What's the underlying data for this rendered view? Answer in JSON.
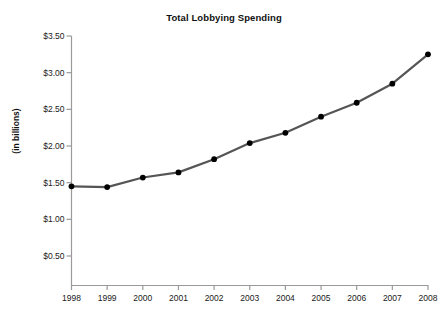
{
  "chart_data": {
    "type": "line",
    "title": "Total Lobbying Spending",
    "xlabel": "",
    "ylabel": "(in billions)",
    "x": [
      1998,
      1999,
      2000,
      2001,
      2002,
      2003,
      2004,
      2005,
      2006,
      2007,
      2008
    ],
    "categories": [
      "1998",
      "1999",
      "2000",
      "2001",
      "2002",
      "2003",
      "2004",
      "2005",
      "2006",
      "2007",
      "2008"
    ],
    "values": [
      1.45,
      1.44,
      1.57,
      1.64,
      1.82,
      2.04,
      2.18,
      2.4,
      2.59,
      2.85,
      3.25
    ],
    "series": [
      {
        "name": "Total Lobbying Spending",
        "values": [
          1.45,
          1.44,
          1.57,
          1.64,
          1.82,
          2.04,
          2.18,
          2.4,
          2.59,
          2.85,
          3.25
        ]
      }
    ],
    "xlim": [
      1998,
      2008
    ],
    "ylim": [
      0.0,
      3.5
    ],
    "ytick_values": [
      3.5,
      3.0,
      2.5,
      2.0,
      1.5,
      1.0,
      0.5
    ],
    "ytick_labels": [
      "$3.50",
      "$3.00",
      "$2.50",
      "$2.00",
      "$1.50",
      "$1.00",
      "$0.50"
    ],
    "xtick_labels": [
      "1998",
      "1999",
      "2000",
      "2001",
      "2002",
      "2003",
      "2004",
      "2005",
      "2006",
      "2007",
      "2008"
    ],
    "grid": false,
    "legend": null,
    "line_color": "#555555",
    "marker_color": "#000000",
    "axis_color": "#999999",
    "background_color": "#ffffff"
  }
}
